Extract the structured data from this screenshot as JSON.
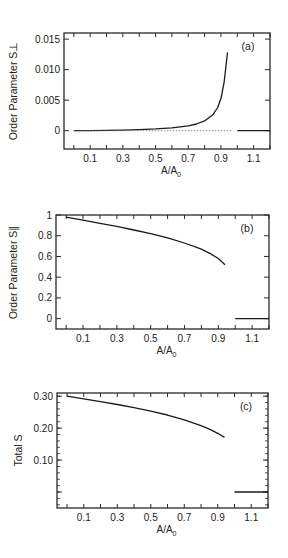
{
  "chart_data": [
    {
      "type": "line",
      "panel_label": "(a)",
      "xlabel": "A/A0",
      "ylabel": "Order Parameter S⊥",
      "xlim": [
        -0.06,
        1.2
      ],
      "ylim": [
        -0.003,
        0.016
      ],
      "x_tick_labels": [
        "0.1",
        "0.3",
        "0.5",
        "0.7",
        "0.9",
        "1.1"
      ],
      "x_ticks": [
        0.1,
        0.3,
        0.5,
        0.7,
        0.9,
        1.1
      ],
      "y_tick_labels": [
        "0",
        "0.005",
        "0.010",
        "0.015"
      ],
      "y_ticks": [
        0,
        0.005,
        0.01,
        0.015
      ],
      "grid": false,
      "series": [
        {
          "name": "S_perp",
          "style": "solid",
          "x": [
            0.0,
            0.1,
            0.2,
            0.3,
            0.4,
            0.5,
            0.6,
            0.7,
            0.75,
            0.8,
            0.85,
            0.88,
            0.9,
            0.92,
            0.94
          ],
          "y": [
            0.0,
            2e-05,
            5e-05,
            0.0001,
            0.00018,
            0.0003,
            0.00048,
            0.0008,
            0.0011,
            0.0016,
            0.0026,
            0.0038,
            0.0053,
            0.008,
            0.0128
          ]
        },
        {
          "name": "zero-reference",
          "style": "dashed",
          "x": [
            0.0,
            0.97
          ],
          "y": [
            0.0,
            0.0
          ]
        },
        {
          "name": "high-area branch",
          "style": "solid",
          "x": [
            1.0,
            1.2
          ],
          "y": [
            0.0,
            0.0
          ]
        }
      ]
    },
    {
      "type": "line",
      "panel_label": "(b)",
      "xlabel": "A/A0",
      "ylabel": "Order Parameter S∥",
      "xlim": [
        -0.06,
        1.2
      ],
      "ylim": [
        -0.1,
        1.0
      ],
      "x_tick_labels": [
        "0.1",
        "0.3",
        "0.5",
        "0.7",
        "0.9",
        "1.1"
      ],
      "x_ticks": [
        0.1,
        0.3,
        0.5,
        0.7,
        0.9,
        1.1
      ],
      "y_tick_labels": [
        "0",
        "0.2",
        "0.4",
        "0.6",
        "0.8",
        "1"
      ],
      "y_ticks": [
        0,
        0.2,
        0.4,
        0.6,
        0.8,
        1.0
      ],
      "grid": false,
      "series": [
        {
          "name": "S_par",
          "style": "solid",
          "x": [
            0.0,
            0.1,
            0.2,
            0.3,
            0.4,
            0.5,
            0.6,
            0.7,
            0.8,
            0.85,
            0.9,
            0.94
          ],
          "y": [
            0.98,
            0.95,
            0.92,
            0.89,
            0.855,
            0.82,
            0.78,
            0.73,
            0.67,
            0.63,
            0.58,
            0.52
          ]
        },
        {
          "name": "high-area branch",
          "style": "solid",
          "x": [
            1.0,
            1.2
          ],
          "y": [
            0.0,
            0.0
          ]
        }
      ]
    },
    {
      "type": "line",
      "panel_label": "(c)",
      "xlabel": "A/A0",
      "ylabel": "Total S",
      "xlim": [
        -0.06,
        1.2
      ],
      "ylim": [
        -0.05,
        0.31
      ],
      "x_tick_labels": [
        "0.1",
        "0.3",
        "0.5",
        "0.7",
        "0.9",
        "1.1"
      ],
      "x_ticks": [
        0.1,
        0.3,
        0.5,
        0.7,
        0.9,
        1.1
      ],
      "y_tick_labels": [
        "0.10",
        "0.20",
        "0.30"
      ],
      "y_ticks": [
        0.1,
        0.2,
        0.3
      ],
      "y_unlabeled_ticks": [
        0.0
      ],
      "grid": false,
      "series": [
        {
          "name": "S_total",
          "style": "solid",
          "x": [
            0.0,
            0.1,
            0.2,
            0.3,
            0.4,
            0.5,
            0.6,
            0.7,
            0.8,
            0.85,
            0.9,
            0.94
          ],
          "y": [
            0.3,
            0.292,
            0.283,
            0.274,
            0.264,
            0.253,
            0.241,
            0.226,
            0.208,
            0.197,
            0.184,
            0.171
          ]
        },
        {
          "name": "high-area branch",
          "style": "solid",
          "x": [
            1.0,
            1.2
          ],
          "y": [
            0.0,
            0.0
          ]
        }
      ]
    }
  ],
  "panels": [
    {
      "frame": {
        "left": 64,
        "top": 33,
        "right": 270,
        "bottom": 149
      },
      "ylabel_x": 17,
      "label_y_offset": 0
    },
    {
      "frame": {
        "left": 56,
        "top": 215,
        "right": 269,
        "bottom": 329
      },
      "ylabel_x": 17,
      "label_y_offset": 0
    },
    {
      "frame": {
        "left": 57,
        "top": 393,
        "right": 268,
        "bottom": 508
      },
      "ylabel_x": 22,
      "label_y_offset": 0
    }
  ],
  "style": {
    "line_color": "#1a1a1a",
    "frame_color": "#2a2a2a",
    "text_color": "#222222"
  }
}
